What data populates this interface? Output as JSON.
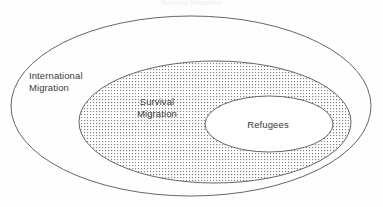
{
  "figure": {
    "caption_partial": "Survival Migration",
    "background_color": "#fefefe",
    "stroke_color": "#555555",
    "text_color": "#3a3a3a",
    "fill_pattern_color": "#8a8a8a"
  },
  "chart_data": {
    "type": "diagram",
    "diagram_kind": "euler-nested-ellipses",
    "title": "Survival Migration",
    "sets": [
      {
        "id": "international-migration",
        "label": "International\nMigration",
        "level": 0,
        "fill": "none",
        "cx": 191,
        "cy": 106,
        "rx": 180,
        "ry": 90
      },
      {
        "id": "survival-migration",
        "label": "Survival\nMigration",
        "level": 1,
        "fill": "dotted",
        "cx": 215,
        "cy": 122,
        "rx": 136,
        "ry": 61
      },
      {
        "id": "refugees",
        "label": "Refugees",
        "level": 2,
        "fill": "none",
        "cx": 269,
        "cy": 124,
        "rx": 64,
        "ry": 28
      }
    ],
    "relationship": "Refugees ⊂ Survival Migration ⊂ International Migration"
  },
  "labels": {
    "international_migration": "International\nMigration",
    "survival_migration": "Survival\nMigration",
    "refugees": "Refugees"
  }
}
